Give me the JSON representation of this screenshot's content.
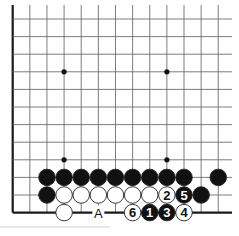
{
  "diagram": {
    "type": "go-board-fragment",
    "grid": {
      "columns": 13,
      "rows": 12,
      "x0": 12.7,
      "dx": 17.13,
      "y0": 19,
      "dy": 17.6,
      "left_edge": true,
      "bottom_edge": true,
      "right_extent": 232
    },
    "colors": {
      "line": "#6e6e6e",
      "edge": "#1a1a1a",
      "black_stone": "#111111",
      "white_stone": "#ffffff",
      "stone_outline": "#222222",
      "star_point": "#111111"
    },
    "star_points": [
      [
        3,
        3
      ],
      [
        9,
        3
      ],
      [
        3,
        8
      ],
      [
        9,
        8
      ]
    ],
    "stones": [
      {
        "col": 2,
        "row": 9,
        "color": "black",
        "label": ""
      },
      {
        "col": 3,
        "row": 9,
        "color": "black",
        "label": ""
      },
      {
        "col": 4,
        "row": 9,
        "color": "black",
        "label": ""
      },
      {
        "col": 5,
        "row": 9,
        "color": "black",
        "label": ""
      },
      {
        "col": 6,
        "row": 9,
        "color": "black",
        "label": ""
      },
      {
        "col": 7,
        "row": 9,
        "color": "black",
        "label": ""
      },
      {
        "col": 8,
        "row": 9,
        "color": "black",
        "label": ""
      },
      {
        "col": 9,
        "row": 9,
        "color": "black",
        "label": ""
      },
      {
        "col": 10,
        "row": 9,
        "color": "black",
        "label": ""
      },
      {
        "col": 12,
        "row": 9,
        "color": "black",
        "label": ""
      },
      {
        "col": 2,
        "row": 10,
        "color": "black",
        "label": ""
      },
      {
        "col": 3,
        "row": 10,
        "color": "white",
        "label": ""
      },
      {
        "col": 4,
        "row": 10,
        "color": "white",
        "label": ""
      },
      {
        "col": 5,
        "row": 10,
        "color": "white",
        "label": ""
      },
      {
        "col": 6,
        "row": 10,
        "color": "white",
        "label": ""
      },
      {
        "col": 7,
        "row": 10,
        "color": "white",
        "label": ""
      },
      {
        "col": 8,
        "row": 10,
        "color": "white",
        "label": ""
      },
      {
        "col": 9,
        "row": 10,
        "color": "white",
        "label": "2"
      },
      {
        "col": 10,
        "row": 10,
        "color": "black",
        "label": "5"
      },
      {
        "col": 11,
        "row": 10,
        "color": "black",
        "label": ""
      },
      {
        "col": 3,
        "row": 11,
        "color": "white",
        "label": ""
      },
      {
        "col": 7,
        "row": 11,
        "color": "white",
        "label": "6"
      },
      {
        "col": 8,
        "row": 11,
        "color": "black",
        "label": "1"
      },
      {
        "col": 9,
        "row": 11,
        "color": "black",
        "label": "3"
      },
      {
        "col": 10,
        "row": 11,
        "color": "white",
        "label": "4"
      }
    ],
    "markers": [
      {
        "col": 5,
        "row": 11,
        "text": "A"
      }
    ]
  }
}
